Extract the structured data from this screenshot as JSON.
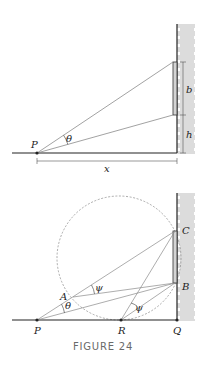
{
  "figure": {
    "caption": "FIGURE 24",
    "top_diagram": {
      "labels": {
        "point_p": "P",
        "angle_theta": "θ",
        "length_b": "b",
        "length_h": "h",
        "distance_x": "x"
      }
    },
    "bottom_diagram": {
      "labels": {
        "point_a": "A",
        "point_b": "B",
        "point_c": "C",
        "point_p": "P",
        "point_r": "R",
        "point_q": "Q",
        "angle_theta": "θ",
        "angle_psi_1": "ψ",
        "angle_psi_2": "ψ"
      }
    },
    "colors": {
      "line": "#222222",
      "thin_line": "#8a8a8a",
      "wall_shade": "#dcdcdc",
      "caption": "#6a6a6a"
    }
  }
}
